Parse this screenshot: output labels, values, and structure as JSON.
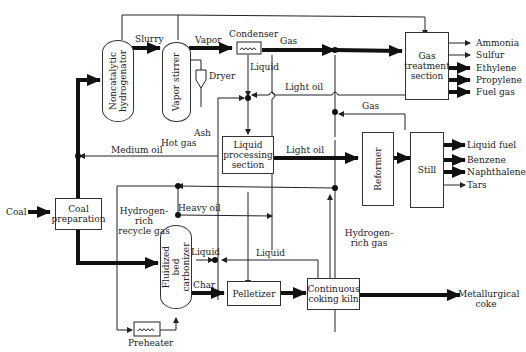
{
  "units": {
    "coal_preparation": "Coal preparation",
    "noncatalytic_hydrogenator": "Noncatalytic hydrogenator",
    "vapor_stirrer": "Vapor stirrer",
    "condenser": "Condenser",
    "dryer": "Dryer",
    "gas_treatment": "Gas treatment section",
    "liquid_processing": "Liquid processing section",
    "reformer": "Reformer",
    "still": "Still",
    "fluidized_bed": "Fluidized bed carbonizer",
    "pelletizer": "Pelletizer",
    "coking_kiln": "Continuous coking kiln",
    "preheater": "Preheater"
  },
  "streams": {
    "coal": "Coal",
    "slurry": "Slurry",
    "vapor": "Vapor",
    "gas_top": "Gas",
    "liquid_condenser": "Liquid",
    "light_oil_top": "Light oil",
    "gas_mid": "Gas",
    "hot_gas": "Hot gas",
    "ash": "Ash",
    "medium_oil": "Medium oil",
    "light_oil_mid": "Light oil",
    "heavy_oil": "Heavy oil",
    "hydrogen_recycle": "Hydrogen-rich recycle gas",
    "hydrogen_rich_gas": "Hydrogen-rich gas",
    "liquid_carbonizer": "Liquid",
    "liquid_kiln": "Liquid",
    "char": "Char"
  },
  "products": {
    "gas_treatment": [
      "Ammonia",
      "Sulfur",
      "Ethylene",
      "Propylene",
      "Fuel gas"
    ],
    "still": [
      "Liquid fuel",
      "Benzene",
      "Naphthalene",
      "Tars"
    ],
    "kiln": "Metallurgical coke"
  }
}
